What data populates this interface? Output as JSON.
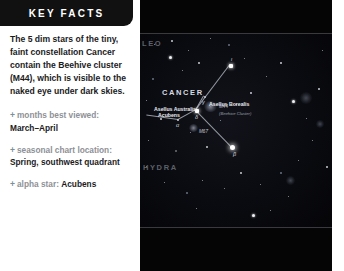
{
  "panel": {
    "title": "KEY FACTS",
    "lead": "The 5 dim stars of the tiny, faint constellation Cancer contain the Beehive cluster (M44), which is visible to the naked eye under dark skies.",
    "marker": "+",
    "facts": [
      {
        "label": "months best viewed:",
        "value": "March–April"
      },
      {
        "label": "seasonal chart location:",
        "value": "Spring, southwest quadrant"
      },
      {
        "label": "alpha star:",
        "value": "Acubens"
      }
    ]
  },
  "starmap": {
    "constellation_labels": [
      {
        "name": "cancer",
        "text": "CANCER"
      },
      {
        "name": "leo",
        "text": "LEO"
      },
      {
        "name": "hydra",
        "text": "HYDRA"
      }
    ],
    "star_labels": [
      {
        "name": "asellus-borealis",
        "text": "Asellus Borealis"
      },
      {
        "name": "asellus-australis",
        "text": "Asellus Australis"
      },
      {
        "name": "acubens",
        "text": "Acubens"
      }
    ],
    "greek_letters": [
      {
        "name": "iota",
        "text": "ι"
      },
      {
        "name": "gamma",
        "text": "γ"
      },
      {
        "name": "delta",
        "text": "δ"
      },
      {
        "name": "alpha",
        "text": "α"
      },
      {
        "name": "beta",
        "text": "β"
      }
    ],
    "deep_sky_objects": [
      {
        "name": "m44",
        "text": "M44",
        "subtext": "(Beehive Cluster)"
      },
      {
        "name": "m67",
        "text": "M67",
        "subtext": ""
      }
    ]
  }
}
